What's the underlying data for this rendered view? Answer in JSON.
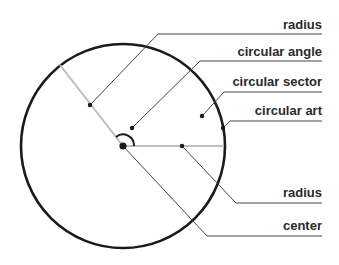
{
  "diagram": {
    "colors": {
      "circle": "#1a1a1a",
      "radius_line": "#bdbdbd",
      "leader_line": "#444444",
      "text": "#2a2a2a"
    },
    "labels": [
      {
        "id": "radius-top",
        "text": "radius"
      },
      {
        "id": "circular-angle",
        "text": "circular angle"
      },
      {
        "id": "circular-sector",
        "text": "circular sector"
      },
      {
        "id": "circular-arc",
        "text": "circular art"
      },
      {
        "id": "radius-bottom",
        "text": "radius"
      },
      {
        "id": "center",
        "text": "center"
      }
    ]
  }
}
